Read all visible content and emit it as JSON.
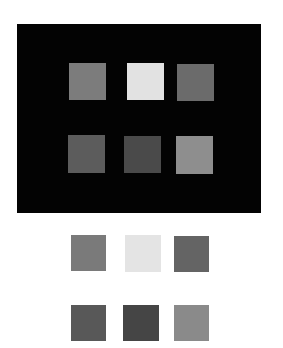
{
  "figure": {
    "background": "#ffffff",
    "dark_panel": {
      "color": "#030303",
      "x": 17,
      "y": 24,
      "w": 244,
      "h": 189
    },
    "dark_panel_squares": [
      {
        "x": 69,
        "y": 63,
        "w": 37,
        "h": 37,
        "color": "#7c7c7c"
      },
      {
        "x": 127,
        "y": 63,
        "w": 37,
        "h": 37,
        "color": "#e2e2e2"
      },
      {
        "x": 177,
        "y": 64,
        "w": 37,
        "h": 37,
        "color": "#6b6b6b"
      },
      {
        "x": 68,
        "y": 135,
        "w": 37,
        "h": 38,
        "color": "#5c5c5c"
      },
      {
        "x": 124,
        "y": 136,
        "w": 37,
        "h": 37,
        "color": "#4a4a4a"
      },
      {
        "x": 176,
        "y": 136,
        "w": 37,
        "h": 38,
        "color": "#8e8e8e"
      }
    ],
    "light_background_squares": [
      {
        "x": 71,
        "y": 235,
        "w": 35,
        "h": 36,
        "color": "#7a7a7a"
      },
      {
        "x": 125,
        "y": 235,
        "w": 36,
        "h": 37,
        "color": "#e4e4e4"
      },
      {
        "x": 174,
        "y": 236,
        "w": 35,
        "h": 36,
        "color": "#646464"
      },
      {
        "x": 71,
        "y": 305,
        "w": 35,
        "h": 36,
        "color": "#585858"
      },
      {
        "x": 123,
        "y": 305,
        "w": 36,
        "h": 36,
        "color": "#454545"
      },
      {
        "x": 174,
        "y": 305,
        "w": 35,
        "h": 36,
        "color": "#8a8a8a"
      }
    ]
  }
}
